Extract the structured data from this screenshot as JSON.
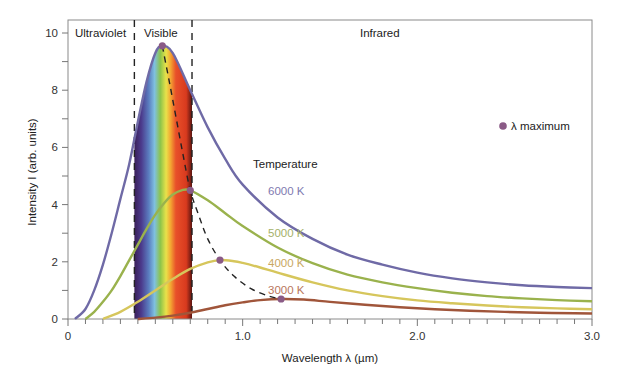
{
  "chart_data": {
    "type": "line",
    "title": "",
    "xlabel": "Wavelength λ (µm)",
    "ylabel": "Intensity I (arb. units)",
    "xlim": [
      0,
      3.0
    ],
    "ylim": [
      0,
      10
    ],
    "x_ticks_major": [
      0,
      1.0,
      2.0,
      3.0
    ],
    "x_tick_labels": [
      "0",
      "1.0",
      "2.0",
      "3.0"
    ],
    "x_tick_minor_step": 0.1,
    "y_ticks_major": [
      0,
      2,
      4,
      6,
      8,
      10
    ],
    "y_tick_labels": [
      "0",
      "2",
      "4",
      "6",
      "8",
      "10"
    ],
    "y_tick_minor_step": 1,
    "grid": false,
    "regions": [
      {
        "label": "Ultraviolet",
        "from": 0,
        "to": 0.38
      },
      {
        "label": "Visible",
        "from": 0.38,
        "to": 0.71
      },
      {
        "label": "Infrared",
        "from": 0.71,
        "to": 3.0
      }
    ],
    "region_boundaries": [
      0.38,
      0.71
    ],
    "legend": {
      "title": "Temperature",
      "marker_label": "λ maximum",
      "marker_color": "#8a5a86"
    },
    "series": [
      {
        "name": "6000 K",
        "color": "#6f6aa6",
        "x": [
          0.04,
          0.1,
          0.15,
          0.2,
          0.25,
          0.3,
          0.35,
          0.4,
          0.45,
          0.5,
          0.54,
          0.6,
          0.7,
          0.8,
          0.9,
          1.0,
          1.2,
          1.4,
          1.6,
          1.8,
          2.0,
          2.2,
          2.4,
          2.6,
          2.8,
          3.0
        ],
        "y": [
          0,
          0.35,
          1.0,
          1.9,
          3.0,
          4.2,
          5.4,
          6.9,
          8.3,
          9.3,
          9.55,
          9.3,
          8.0,
          6.7,
          5.6,
          4.7,
          3.55,
          2.8,
          2.25,
          1.9,
          1.62,
          1.42,
          1.28,
          1.18,
          1.12,
          1.08
        ]
      },
      {
        "name": "5000 K",
        "color": "#9ab24d",
        "x": [
          0.1,
          0.15,
          0.2,
          0.25,
          0.3,
          0.35,
          0.4,
          0.45,
          0.5,
          0.55,
          0.6,
          0.65,
          0.7,
          0.8,
          0.9,
          1.0,
          1.2,
          1.4,
          1.6,
          1.8,
          2.0,
          2.2,
          2.4,
          2.6,
          2.8,
          3.0
        ],
        "y": [
          0,
          0.25,
          0.6,
          1.0,
          1.5,
          2.05,
          2.6,
          3.15,
          3.65,
          4.05,
          4.35,
          4.5,
          4.5,
          4.15,
          3.7,
          3.25,
          2.5,
          1.95,
          1.55,
          1.28,
          1.08,
          0.92,
          0.8,
          0.72,
          0.66,
          0.62
        ]
      },
      {
        "name": "4000 K",
        "color": "#d6c65c",
        "x": [
          0.2,
          0.3,
          0.4,
          0.5,
          0.6,
          0.7,
          0.8,
          0.87,
          0.95,
          1.0,
          1.1,
          1.2,
          1.4,
          1.6,
          1.8,
          2.0,
          2.2,
          2.4,
          2.6,
          2.8,
          3.0
        ],
        "y": [
          0,
          0.25,
          0.6,
          1.0,
          1.4,
          1.75,
          1.98,
          2.06,
          2.02,
          1.96,
          1.8,
          1.62,
          1.28,
          1.0,
          0.8,
          0.65,
          0.55,
          0.47,
          0.41,
          0.37,
          0.34
        ]
      },
      {
        "name": "3000 K",
        "color": "#a0553a",
        "x": [
          0.4,
          0.5,
          0.6,
          0.7,
          0.8,
          0.9,
          1.0,
          1.1,
          1.22,
          1.35,
          1.5,
          1.7,
          1.9,
          2.1,
          2.3,
          2.5,
          2.7,
          2.9,
          3.0
        ],
        "y": [
          0,
          0.05,
          0.12,
          0.22,
          0.35,
          0.48,
          0.58,
          0.66,
          0.7,
          0.68,
          0.6,
          0.5,
          0.41,
          0.34,
          0.29,
          0.25,
          0.22,
          0.2,
          0.19
        ]
      }
    ],
    "lambda_max_points": [
      {
        "series": "6000 K",
        "x": 0.54,
        "y": 9.55
      },
      {
        "series": "5000 K",
        "x": 0.7,
        "y": 4.5
      },
      {
        "series": "4000 K",
        "x": 0.87,
        "y": 2.06
      },
      {
        "series": "3000 K",
        "x": 1.22,
        "y": 0.7
      }
    ],
    "lambda_max_curve": {
      "style": "dashed",
      "x": [
        0.54,
        0.58,
        0.62,
        0.66,
        0.7,
        0.75,
        0.8,
        0.87,
        0.95,
        1.05,
        1.15,
        1.22
      ],
      "y": [
        9.55,
        8.3,
        7.0,
        5.7,
        4.5,
        3.6,
        2.8,
        2.06,
        1.5,
        1.05,
        0.8,
        0.7
      ]
    },
    "annotations": [
      {
        "text": "6000 K",
        "x": 1.15,
        "y": 4.6,
        "color": "#7f7ab0"
      },
      {
        "text": "5000 K",
        "x": 1.15,
        "y": 2.95,
        "color": "#a5b169"
      },
      {
        "text": "4000 K",
        "x": 1.15,
        "y": 1.9,
        "color": "#c9b062"
      },
      {
        "text": "3000 K",
        "x": 1.15,
        "y": 1.1,
        "color": "#b9765c"
      }
    ]
  },
  "labels": {
    "ultraviolet": "Ultraviolet",
    "visible": "Visible",
    "infrared": "Infrared",
    "temperature": "Temperature",
    "lambda_max": "λ maximum",
    "x_axis": "Wavelength λ (µm)",
    "y_axis": "Intensity I (arb. units)",
    "t6000": "6000 K",
    "t5000": "5000 K",
    "t4000": "4000 K",
    "t3000": "3000 K"
  }
}
